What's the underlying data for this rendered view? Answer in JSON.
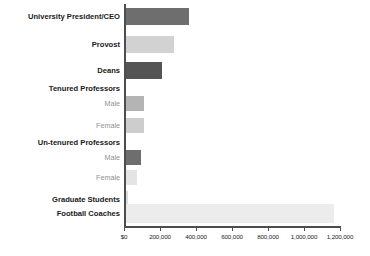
{
  "chart_data": {
    "type": "bar",
    "orientation": "horizontal",
    "title": "",
    "subtitle": "",
    "xlabel": "",
    "ylabel": "",
    "xlim": [
      0,
      1233000
    ],
    "grid": false,
    "legend": null,
    "axis": {
      "tick_values": [
        0,
        200000,
        400000,
        600000,
        800000,
        1000000,
        1200000
      ],
      "tick_labels": [
        "$0",
        "200,000",
        "400,000",
        "600,000",
        "800,000",
        "1,000,000",
        "1,200,000"
      ]
    },
    "categories": [
      "University President/CEO",
      "Provost",
      "Deans",
      "Tenured Professors",
      "Male",
      "Female",
      "Un-tenured Professors",
      "Male",
      "Female",
      "Graduate Students",
      "Football Coaches"
    ],
    "bars": [
      {
        "label": "University President/CEO",
        "value": 355000,
        "color": "#6e6e6e",
        "style": "major",
        "kind": "bar"
      },
      {
        "label": "Provost",
        "value": 272000,
        "color": "#d2d2d2",
        "style": "major",
        "kind": "bar"
      },
      {
        "label": "Deans",
        "value": 205000,
        "color": "#545454",
        "style": "major",
        "kind": "bar"
      },
      {
        "label": "Tenured Professors",
        "value": null,
        "color": null,
        "style": "major",
        "kind": "group-header"
      },
      {
        "label": "Male",
        "value": 106000,
        "color": "#b4b4b4",
        "style": "minor",
        "kind": "bar"
      },
      {
        "label": "Female",
        "value": 104000,
        "color": "#cdcdcd",
        "style": "minor",
        "kind": "bar"
      },
      {
        "label": "Un-tenured Professors",
        "value": null,
        "color": null,
        "style": "major",
        "kind": "group-header"
      },
      {
        "label": "Male",
        "value": 89000,
        "color": "#6e6e6e",
        "style": "minor",
        "kind": "bar"
      },
      {
        "label": "Female",
        "value": 67000,
        "color": "#e4e4e4",
        "style": "minor",
        "kind": "bar"
      },
      {
        "label": "Graduate Students",
        "value": 18000,
        "color": "#dcdcdc",
        "style": "major",
        "kind": "bar"
      },
      {
        "label": "Football Coaches",
        "value": 1160000,
        "color": "#ececec",
        "style": "major",
        "kind": "bar"
      }
    ]
  },
  "colors": {
    "axis": "#4d4d4d",
    "major_label": "#1a1a1a",
    "minor_label": "#8f8f8f",
    "tick_label": "#222222",
    "background": "#ffffff"
  }
}
